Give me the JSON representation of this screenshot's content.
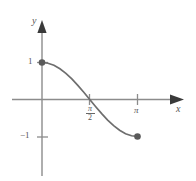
{
  "figure": {
    "kind": "math-graph",
    "axis_color": "#8c8c8c",
    "curve_color": "#6e6e6e",
    "point_color": "#5a5a5a",
    "text_color": "#555555",
    "background": "#ffffff"
  },
  "labels": {
    "x_axis": "x",
    "y_axis": "y",
    "y_tick_pos": "1",
    "y_tick_neg": "−1",
    "x_tick_pi_over_2_num": "π",
    "x_tick_pi_over_2_den": "2",
    "x_tick_pi": "π"
  },
  "chart_data": {
    "type": "line",
    "title": "",
    "xlabel": "x",
    "ylabel": "y",
    "grid": false,
    "legend": "none",
    "xlim": [
      -0.65,
      3.95
    ],
    "ylim": [
      -2.45,
      1.6
    ],
    "xticks": [
      1.5707963,
      3.1415927
    ],
    "xtick_labels": [
      "π/2",
      "π"
    ],
    "yticks": [
      1,
      -1
    ],
    "ytick_labels": [
      "1",
      "−1"
    ],
    "series": [
      {
        "name": "y = cos x",
        "function": "cos(x)",
        "domain": [
          0,
          3.1415927
        ],
        "endpoints": [
          {
            "x": 0,
            "y": 1,
            "marker": "closed-dot"
          },
          {
            "x": 3.1415927,
            "y": -1,
            "marker": "closed-dot"
          }
        ],
        "x": [
          0,
          0.1963,
          0.3927,
          0.589,
          0.7854,
          0.9817,
          1.1781,
          1.3744,
          1.5708,
          1.7671,
          1.9635,
          2.1598,
          2.3562,
          2.5525,
          2.7489,
          2.9452,
          3.1416
        ],
        "values": [
          1,
          0.9808,
          0.9239,
          0.8315,
          0.7071,
          0.5556,
          0.3827,
          0.1951,
          0,
          -0.1951,
          -0.3827,
          -0.5556,
          -0.7071,
          -0.8315,
          -0.9239,
          -0.9808,
          -1
        ]
      }
    ]
  }
}
